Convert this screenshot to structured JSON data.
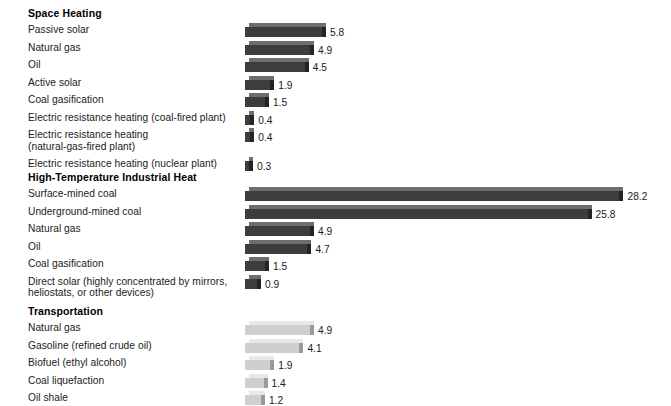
{
  "chart_data": {
    "type": "bar",
    "title": "",
    "xlabel": "",
    "ylabel": "",
    "orientation": "horizontal",
    "grid": false,
    "legend": "none",
    "xlim": [
      0,
      30
    ],
    "groups": [
      {
        "name": "Space Heating",
        "bar_color": "#3d3d3d",
        "top_color": "#6e6e6e",
        "side_color": "#242424",
        "categories": [
          "Passive solar",
          "Natural gas",
          "Oil",
          "Active solar",
          "Coal gasification",
          "Electric resistance heating (coal-fired plant)",
          "Electric resistance heating\n(natural-gas-fired plant)",
          "Electric resistance heating (nuclear plant)"
        ],
        "values": [
          5.8,
          4.9,
          4.5,
          1.9,
          1.5,
          0.4,
          0.4,
          0.3
        ]
      },
      {
        "name": "High-Temperature Industrial Heat",
        "bar_color": "#3d3d3d",
        "top_color": "#6e6e6e",
        "side_color": "#242424",
        "categories": [
          "Surface-mined coal",
          "Underground-mined coal",
          "Natural gas",
          "Oil",
          "Coal gasification",
          "Direct solar (highly concentrated by mirrors,\nheliostats, or other devices)"
        ],
        "values": [
          28.2,
          25.8,
          4.9,
          4.7,
          1.5,
          0.9
        ]
      },
      {
        "name": "Transportation",
        "bar_color": "#cfcfcf",
        "top_color": "#e8e8e8",
        "side_color": "#9a9a9a",
        "categories": [
          "Natural gas",
          "Gasoline (refined crude oil)",
          "Biofuel (ethyl alcohol)",
          "Coal liquefaction",
          "Oil shale"
        ],
        "values": [
          4.9,
          4.1,
          1.9,
          1.4,
          1.2
        ]
      }
    ]
  },
  "layout": {
    "bar_origin_x": 245,
    "px_per_unit": 13.28,
    "label_x": 28,
    "rows": [
      {
        "group": 0,
        "header_y": 7,
        "first_row_y": 24,
        "row_step": 17.5
      },
      {
        "group": 1,
        "header_y": 171,
        "first_row_y": 188,
        "row_step": 17.5
      },
      {
        "group": 2,
        "header_y": 305,
        "first_row_y": 322,
        "row_step": 17.5
      }
    ]
  }
}
